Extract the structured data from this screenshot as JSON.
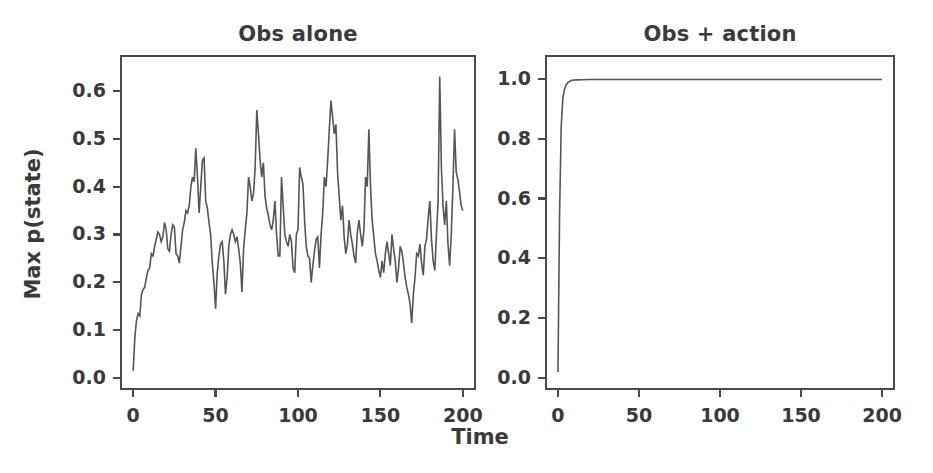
{
  "figure": {
    "xlabel": "Time",
    "ylabel": "Max p(state)",
    "background_color": "#ffffff",
    "line_color": "#555555",
    "axis_color": "#4a4a4a"
  },
  "panels": [
    {
      "id": "obs-alone",
      "title": "Obs alone",
      "yticks": [
        "0.0",
        "0.1",
        "0.2",
        "0.3",
        "0.4",
        "0.5",
        "0.6"
      ],
      "xticks": [
        "0",
        "50",
        "100",
        "150",
        "200"
      ]
    },
    {
      "id": "obs-plus-action",
      "title": "Obs + action",
      "yticks": [
        "0.0",
        "0.2",
        "0.4",
        "0.6",
        "0.8",
        "1.0"
      ],
      "xticks": [
        "0",
        "50",
        "100",
        "150",
        "200"
      ]
    }
  ],
  "chart_data": [
    {
      "type": "line",
      "id": "obs-alone",
      "title": "Obs alone",
      "xlabel": "Time",
      "ylabel": "Max p(state)",
      "xlim": [
        -8,
        208
      ],
      "ylim": [
        -0.025,
        0.675
      ],
      "xticks": [
        0,
        50,
        100,
        150,
        200
      ],
      "yticks": [
        0.0,
        0.1,
        0.2,
        0.3,
        0.4,
        0.5,
        0.6
      ],
      "grid": false,
      "legend": null,
      "series": [
        {
          "name": "Max p(state) obs only",
          "x": [
            0,
            1,
            2,
            3,
            4,
            5,
            6,
            7,
            8,
            9,
            10,
            11,
            12,
            13,
            14,
            15,
            16,
            17,
            18,
            19,
            20,
            21,
            22,
            23,
            24,
            25,
            26,
            27,
            28,
            29,
            30,
            31,
            32,
            33,
            34,
            35,
            36,
            37,
            38,
            39,
            40,
            41,
            42,
            43,
            44,
            45,
            46,
            47,
            48,
            49,
            50,
            51,
            52,
            53,
            54,
            55,
            56,
            57,
            58,
            59,
            60,
            61,
            62,
            63,
            64,
            65,
            66,
            67,
            68,
            69,
            70,
            71,
            72,
            73,
            74,
            75,
            76,
            77,
            78,
            79,
            80,
            81,
            82,
            83,
            84,
            85,
            86,
            87,
            88,
            89,
            90,
            91,
            92,
            93,
            94,
            95,
            96,
            97,
            98,
            99,
            100,
            101,
            102,
            103,
            104,
            105,
            106,
            107,
            108,
            109,
            110,
            111,
            112,
            113,
            114,
            115,
            116,
            117,
            118,
            119,
            120,
            121,
            122,
            123,
            124,
            125,
            126,
            127,
            128,
            129,
            130,
            131,
            132,
            133,
            134,
            135,
            136,
            137,
            138,
            139,
            140,
            141,
            142,
            143,
            144,
            145,
            146,
            147,
            148,
            149,
            150,
            151,
            152,
            153,
            154,
            155,
            156,
            157,
            158,
            159,
            160,
            161,
            162,
            163,
            164,
            165,
            166,
            167,
            168,
            169,
            170,
            171,
            172,
            173,
            174,
            175,
            176,
            177,
            178,
            179,
            180,
            181,
            182,
            183,
            184,
            185,
            186,
            187,
            188,
            189,
            190,
            191,
            192,
            193,
            194,
            195,
            196,
            197,
            198,
            199,
            200
          ],
          "values": [
            0.015,
            0.085,
            0.12,
            0.135,
            0.13,
            0.175,
            0.185,
            0.19,
            0.21,
            0.225,
            0.23,
            0.26,
            0.255,
            0.275,
            0.29,
            0.305,
            0.3,
            0.285,
            0.295,
            0.325,
            0.31,
            0.27,
            0.265,
            0.3,
            0.32,
            0.315,
            0.26,
            0.255,
            0.24,
            0.275,
            0.31,
            0.325,
            0.35,
            0.345,
            0.36,
            0.4,
            0.42,
            0.41,
            0.48,
            0.42,
            0.345,
            0.4,
            0.455,
            0.46,
            0.37,
            0.355,
            0.325,
            0.3,
            0.24,
            0.2,
            0.145,
            0.22,
            0.255,
            0.28,
            0.285,
            0.245,
            0.175,
            0.21,
            0.275,
            0.3,
            0.31,
            0.3,
            0.285,
            0.295,
            0.27,
            0.24,
            0.18,
            0.27,
            0.31,
            0.345,
            0.42,
            0.4,
            0.37,
            0.385,
            0.44,
            0.56,
            0.51,
            0.455,
            0.42,
            0.45,
            0.38,
            0.355,
            0.34,
            0.32,
            0.31,
            0.33,
            0.37,
            0.3,
            0.255,
            0.255,
            0.42,
            0.36,
            0.3,
            0.285,
            0.275,
            0.3,
            0.285,
            0.23,
            0.22,
            0.3,
            0.31,
            0.44,
            0.42,
            0.405,
            0.33,
            0.275,
            0.255,
            0.25,
            0.2,
            0.235,
            0.265,
            0.29,
            0.295,
            0.23,
            0.3,
            0.345,
            0.42,
            0.4,
            0.455,
            0.52,
            0.58,
            0.545,
            0.51,
            0.53,
            0.43,
            0.38,
            0.33,
            0.36,
            0.295,
            0.26,
            0.28,
            0.33,
            0.3,
            0.28,
            0.255,
            0.24,
            0.305,
            0.33,
            0.3,
            0.275,
            0.31,
            0.42,
            0.4,
            0.52,
            0.4,
            0.33,
            0.295,
            0.26,
            0.245,
            0.225,
            0.21,
            0.245,
            0.22,
            0.26,
            0.285,
            0.26,
            0.235,
            0.3,
            0.27,
            0.245,
            0.2,
            0.23,
            0.275,
            0.265,
            0.24,
            0.21,
            0.19,
            0.175,
            0.155,
            0.115,
            0.175,
            0.21,
            0.26,
            0.255,
            0.28,
            0.24,
            0.215,
            0.275,
            0.29,
            0.335,
            0.37,
            0.29,
            0.245,
            0.225,
            0.3,
            0.37,
            0.63,
            0.44,
            0.36,
            0.32,
            0.37,
            0.28,
            0.235,
            0.3,
            0.4,
            0.52,
            0.43,
            0.415,
            0.39,
            0.36,
            0.35,
            0.44,
            0.5,
            0.53
          ]
        }
      ]
    },
    {
      "type": "line",
      "id": "obs-plus-action",
      "title": "Obs + action",
      "xlabel": "Time",
      "ylabel": "Max p(state)",
      "xlim": [
        -8,
        208
      ],
      "ylim": [
        -0.04,
        1.08
      ],
      "xticks": [
        0,
        50,
        100,
        150,
        200
      ],
      "yticks": [
        0.0,
        0.2,
        0.4,
        0.6,
        0.8,
        1.0
      ],
      "grid": false,
      "legend": null,
      "series": [
        {
          "name": "Max p(state) obs + action",
          "x": [
            0,
            1,
            2,
            3,
            4,
            5,
            6,
            7,
            8,
            9,
            10,
            12,
            15,
            20,
            30,
            40,
            50,
            60,
            70,
            80,
            90,
            100,
            110,
            120,
            130,
            140,
            150,
            160,
            170,
            180,
            190,
            200
          ],
          "values": [
            0.02,
            0.55,
            0.84,
            0.935,
            0.965,
            0.98,
            0.987,
            0.991,
            0.994,
            0.996,
            0.9965,
            0.997,
            0.9975,
            0.998,
            0.998,
            0.998,
            0.998,
            0.998,
            0.998,
            0.998,
            0.998,
            0.998,
            0.998,
            0.998,
            0.998,
            0.998,
            0.998,
            0.998,
            0.998,
            0.998,
            0.998,
            0.998
          ]
        }
      ]
    }
  ]
}
